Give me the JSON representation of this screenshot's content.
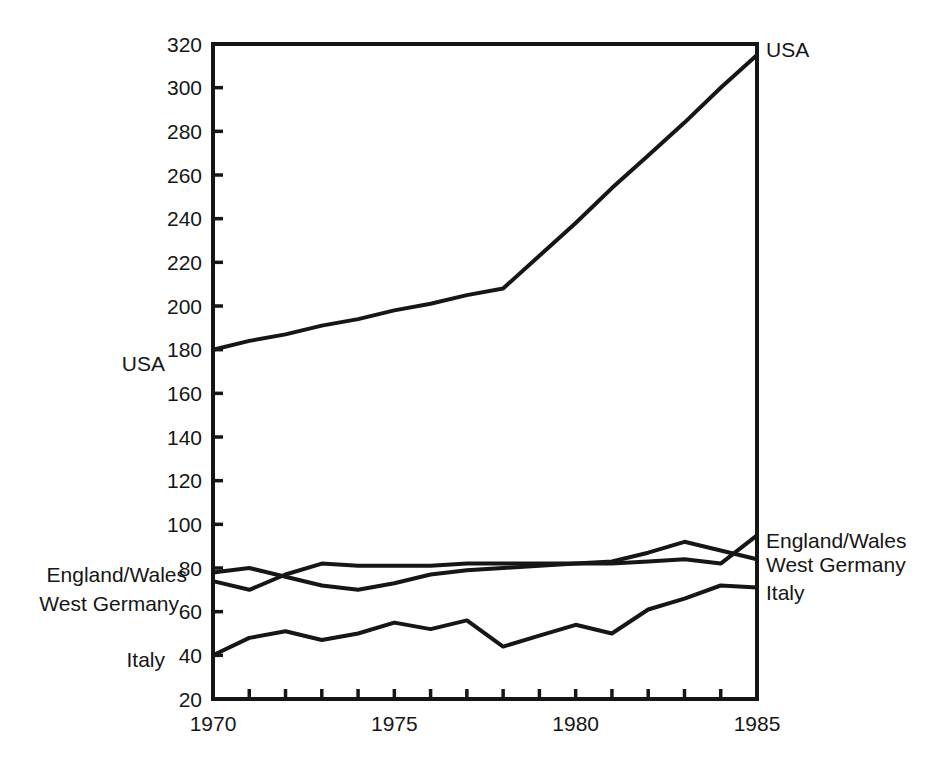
{
  "chart_data": {
    "type": "line",
    "title": "",
    "xlabel": "",
    "ylabel": "",
    "background": "#ffffff",
    "line_color": "#161616",
    "grid": false,
    "frame": true,
    "tick_direction": "in",
    "x": [
      1970,
      1971,
      1972,
      1973,
      1974,
      1975,
      1976,
      1977,
      1978,
      1979,
      1980,
      1981,
      1982,
      1983,
      1984,
      1985
    ],
    "x_label_ticks": [
      "1970",
      "1975",
      "1980",
      "1985"
    ],
    "ylim": [
      20,
      320
    ],
    "ytick_step": 20,
    "series": [
      {
        "name": "USA",
        "values": [
          180,
          184,
          187,
          191,
          194,
          198,
          201,
          205,
          208,
          223,
          238,
          254,
          269,
          284,
          300,
          315
        ]
      },
      {
        "name": "England/Wales",
        "values": [
          78,
          80,
          76,
          72,
          70,
          73,
          77,
          79,
          80,
          81,
          82,
          82,
          83,
          84,
          82,
          95
        ]
      },
      {
        "name": "West Germany",
        "values": [
          74,
          70,
          77,
          82,
          81,
          81,
          81,
          82,
          82,
          82,
          82,
          83,
          87,
          92,
          88,
          84
        ]
      },
      {
        "name": "Italy",
        "values": [
          40,
          48,
          51,
          47,
          50,
          55,
          52,
          56,
          44,
          49,
          54,
          50,
          61,
          66,
          72,
          71
        ]
      }
    ],
    "left_labels": [
      {
        "text": "USA",
        "series": "USA"
      },
      {
        "text": "England/Wales",
        "series": "England/Wales"
      },
      {
        "text": "West Germany",
        "series": "West Germany"
      },
      {
        "text": "Italy",
        "series": "Italy"
      }
    ],
    "right_labels": [
      {
        "text": "USA",
        "series": "USA"
      },
      {
        "text": "England/Wales",
        "series": "England/Wales"
      },
      {
        "text": "West Germany",
        "series": "West Germany"
      },
      {
        "text": "Italy",
        "series": "Italy"
      }
    ]
  }
}
